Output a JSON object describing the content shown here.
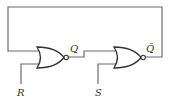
{
  "diagram": {
    "type": "logic-circuit",
    "gates": [
      {
        "id": "gate1",
        "kind": "NOR",
        "output_label": "Q",
        "external_input_label": "R"
      },
      {
        "id": "gate2",
        "kind": "NOR",
        "output_label": "Q̄",
        "external_input_label": "S"
      }
    ],
    "labels": {
      "q": "Q",
      "q_bar": "Q̄",
      "r": "R",
      "s": "S"
    },
    "connections": [
      {
        "from": "gate1.output (Q)",
        "to": "gate2.input_top"
      },
      {
        "from": "gate2.output (Q̄)",
        "to": "gate1.input_top",
        "route": "feedback loop over the top"
      },
      {
        "from": "R",
        "to": "gate1.input_bottom"
      },
      {
        "from": "S",
        "to": "gate2.input_bottom"
      }
    ],
    "colors": {
      "wire": "#6a6a6a",
      "gate_outline": "#333333",
      "background": "#ffffff"
    }
  }
}
